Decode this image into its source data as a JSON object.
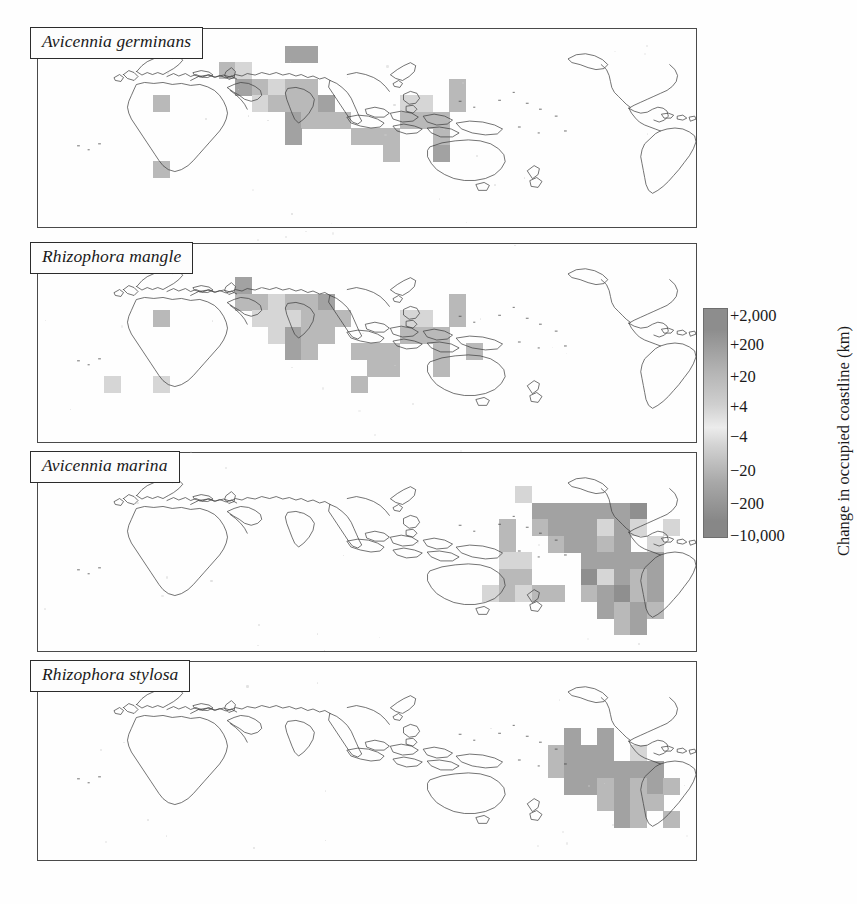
{
  "figure": {
    "type": "four-panel world map grid",
    "panels": [
      {
        "id": "panel-1",
        "species": "Avicennia germinans"
      },
      {
        "id": "panel-2",
        "species": "Rhizophora mangle"
      },
      {
        "id": "panel-3",
        "species": "Avicennia marina"
      },
      {
        "id": "panel-4",
        "species": "Rhizophora stylosa"
      }
    ]
  },
  "legend": {
    "title": "Change in occupied coastline (km)",
    "ticks": [
      "+2,000",
      "+200",
      "+20",
      "+4",
      "−4",
      "−20",
      "−200",
      "−10,000"
    ],
    "colors": {
      "high_positive": "#8d8d8d",
      "mid_positive": "#b5b5b5",
      "neutral_light": "#ececec",
      "mid_negative": "#a8a8a8",
      "high_negative": "#878787"
    }
  },
  "chart_data": {
    "type": "heatmap",
    "title": "Change in occupied coastline (km)",
    "xlabel": "Longitude",
    "ylabel": "Latitude",
    "grid": true,
    "legend_position": "right",
    "projection": "equirectangular, Pacific-centred",
    "cell_size_deg": 10,
    "colorbar_ticks": [
      "+2,000",
      "+200",
      "+20",
      "+4",
      "−4",
      "−20",
      "−200",
      "−10,000"
    ],
    "panels": [
      {
        "name": "Avicennia germinans",
        "cells": [
          {
            "cx": 7,
            "cy": 4,
            "v": "+20"
          },
          {
            "cx": 7,
            "cy": 8,
            "v": "+20"
          },
          {
            "cx": 11,
            "cy": 2,
            "v": "+20"
          },
          {
            "cx": 12,
            "cy": 2,
            "v": "+4"
          },
          {
            "cx": 15,
            "cy": 1,
            "v": "+200"
          },
          {
            "cx": 16,
            "cy": 1,
            "v": "+200"
          },
          {
            "cx": 12,
            "cy": 3,
            "v": "+200"
          },
          {
            "cx": 13,
            "cy": 3,
            "v": "+20"
          },
          {
            "cx": 14,
            "cy": 3,
            "v": "+4"
          },
          {
            "cx": 15,
            "cy": 3,
            "v": "+20"
          },
          {
            "cx": 16,
            "cy": 3,
            "v": "+20"
          },
          {
            "cx": 13,
            "cy": 4,
            "v": "+4"
          },
          {
            "cx": 14,
            "cy": 4,
            "v": "+20"
          },
          {
            "cx": 15,
            "cy": 4,
            "v": "+20"
          },
          {
            "cx": 16,
            "cy": 4,
            "v": "+20"
          },
          {
            "cx": 17,
            "cy": 4,
            "v": "+200"
          },
          {
            "cx": 15,
            "cy": 5,
            "v": "+200"
          },
          {
            "cx": 16,
            "cy": 5,
            "v": "+20"
          },
          {
            "cx": 17,
            "cy": 5,
            "v": "+20"
          },
          {
            "cx": 18,
            "cy": 5,
            "v": "+20"
          },
          {
            "cx": 15,
            "cy": 6,
            "v": "+200"
          },
          {
            "cx": 19,
            "cy": 6,
            "v": "+20"
          },
          {
            "cx": 20,
            "cy": 6,
            "v": "+20"
          },
          {
            "cx": 21,
            "cy": 6,
            "v": "+20"
          },
          {
            "cx": 21,
            "cy": 7,
            "v": "+20"
          },
          {
            "cx": 25,
            "cy": 3,
            "v": "+20"
          },
          {
            "cx": 25,
            "cy": 4,
            "v": "+20"
          },
          {
            "cx": 22,
            "cy": 4,
            "v": "+4"
          },
          {
            "cx": 23,
            "cy": 4,
            "v": "+4"
          },
          {
            "cx": 22,
            "cy": 5,
            "v": "+20"
          },
          {
            "cx": 23,
            "cy": 5,
            "v": "+20"
          },
          {
            "cx": 24,
            "cy": 5,
            "v": "+20"
          },
          {
            "cx": 24,
            "cy": 6,
            "v": "+20"
          },
          {
            "cx": 24,
            "cy": 7,
            "v": "+200"
          }
        ]
      },
      {
        "name": "Rhizophora mangle",
        "cells": [
          {
            "cx": 7,
            "cy": 4,
            "v": "+20"
          },
          {
            "cx": 7,
            "cy": 8,
            "v": "+4"
          },
          {
            "cx": 4,
            "cy": 8,
            "v": "+4"
          },
          {
            "cx": 12,
            "cy": 2,
            "v": "+200"
          },
          {
            "cx": 12,
            "cy": 3,
            "v": "+20"
          },
          {
            "cx": 13,
            "cy": 3,
            "v": "+20"
          },
          {
            "cx": 14,
            "cy": 3,
            "v": "+4"
          },
          {
            "cx": 15,
            "cy": 3,
            "v": "+20"
          },
          {
            "cx": 16,
            "cy": 3,
            "v": "+20"
          },
          {
            "cx": 17,
            "cy": 3,
            "v": "+200"
          },
          {
            "cx": 13,
            "cy": 4,
            "v": "+4"
          },
          {
            "cx": 14,
            "cy": 4,
            "v": "+4"
          },
          {
            "cx": 15,
            "cy": 4,
            "v": "+4"
          },
          {
            "cx": 16,
            "cy": 4,
            "v": "+20"
          },
          {
            "cx": 17,
            "cy": 4,
            "v": "+20"
          },
          {
            "cx": 18,
            "cy": 4,
            "v": "+20"
          },
          {
            "cx": 14,
            "cy": 5,
            "v": "+4"
          },
          {
            "cx": 15,
            "cy": 5,
            "v": "+200"
          },
          {
            "cx": 16,
            "cy": 5,
            "v": "+20"
          },
          {
            "cx": 17,
            "cy": 5,
            "v": "+20"
          },
          {
            "cx": 15,
            "cy": 6,
            "v": "+200"
          },
          {
            "cx": 16,
            "cy": 6,
            "v": "+20"
          },
          {
            "cx": 19,
            "cy": 6,
            "v": "+20"
          },
          {
            "cx": 20,
            "cy": 6,
            "v": "+20"
          },
          {
            "cx": 21,
            "cy": 6,
            "v": "+20"
          },
          {
            "cx": 20,
            "cy": 7,
            "v": "+20"
          },
          {
            "cx": 21,
            "cy": 7,
            "v": "+20"
          },
          {
            "cx": 19,
            "cy": 8,
            "v": "+20"
          },
          {
            "cx": 25,
            "cy": 3,
            "v": "+20"
          },
          {
            "cx": 25,
            "cy": 4,
            "v": "+20"
          },
          {
            "cx": 22,
            "cy": 4,
            "v": "+4"
          },
          {
            "cx": 23,
            "cy": 4,
            "v": "+4"
          },
          {
            "cx": 22,
            "cy": 5,
            "v": "+20"
          },
          {
            "cx": 23,
            "cy": 5,
            "v": "+20"
          },
          {
            "cx": 24,
            "cy": 5,
            "v": "+20"
          },
          {
            "cx": 24,
            "cy": 6,
            "v": "+20"
          },
          {
            "cx": 24,
            "cy": 7,
            "v": "+20"
          },
          {
            "cx": 26,
            "cy": 6,
            "v": "+20"
          }
        ]
      },
      {
        "name": "Avicennia marina",
        "cells": [
          {
            "cx": 29,
            "cy": 2,
            "v": "+4"
          },
          {
            "cx": 28,
            "cy": 4,
            "v": "+20"
          },
          {
            "cx": 28,
            "cy": 5,
            "v": "+20"
          },
          {
            "cx": 28,
            "cy": 6,
            "v": "+4"
          },
          {
            "cx": 29,
            "cy": 6,
            "v": "+4"
          },
          {
            "cx": 28,
            "cy": 7,
            "v": "+20"
          },
          {
            "cx": 29,
            "cy": 7,
            "v": "+20"
          },
          {
            "cx": 27,
            "cy": 8,
            "v": "+4"
          },
          {
            "cx": 28,
            "cy": 8,
            "v": "+20"
          },
          {
            "cx": 29,
            "cy": 8,
            "v": "+4"
          },
          {
            "cx": 30,
            "cy": 3,
            "v": "+200"
          },
          {
            "cx": 31,
            "cy": 3,
            "v": "+200"
          },
          {
            "cx": 32,
            "cy": 3,
            "v": "+200"
          },
          {
            "cx": 33,
            "cy": 3,
            "v": "+200"
          },
          {
            "cx": 34,
            "cy": 3,
            "v": "+200"
          },
          {
            "cx": 35,
            "cy": 3,
            "v": "+200"
          },
          {
            "cx": 36,
            "cy": 3,
            "v": "+2,000"
          },
          {
            "cx": 30,
            "cy": 4,
            "v": "+20"
          },
          {
            "cx": 31,
            "cy": 4,
            "v": "+200"
          },
          {
            "cx": 32,
            "cy": 4,
            "v": "+200"
          },
          {
            "cx": 33,
            "cy": 4,
            "v": "+200"
          },
          {
            "cx": 34,
            "cy": 4,
            "v": "+4"
          },
          {
            "cx": 35,
            "cy": 4,
            "v": "+200"
          },
          {
            "cx": 36,
            "cy": 4,
            "v": "+4"
          },
          {
            "cx": 38,
            "cy": 4,
            "v": "+4"
          },
          {
            "cx": 31,
            "cy": 5,
            "v": "+20"
          },
          {
            "cx": 32,
            "cy": 5,
            "v": "+200"
          },
          {
            "cx": 33,
            "cy": 5,
            "v": "+200"
          },
          {
            "cx": 34,
            "cy": 5,
            "v": "+20"
          },
          {
            "cx": 35,
            "cy": 5,
            "v": "+200"
          },
          {
            "cx": 37,
            "cy": 5,
            "v": "+4"
          },
          {
            "cx": 33,
            "cy": 6,
            "v": "+200"
          },
          {
            "cx": 34,
            "cy": 6,
            "v": "+200"
          },
          {
            "cx": 35,
            "cy": 6,
            "v": "+200"
          },
          {
            "cx": 36,
            "cy": 6,
            "v": "+200"
          },
          {
            "cx": 37,
            "cy": 6,
            "v": "+200"
          },
          {
            "cx": 30,
            "cy": 8,
            "v": "+20"
          },
          {
            "cx": 31,
            "cy": 8,
            "v": "+20"
          },
          {
            "cx": 33,
            "cy": 7,
            "v": "+2,000"
          },
          {
            "cx": 34,
            "cy": 7,
            "v": "+4"
          },
          {
            "cx": 35,
            "cy": 7,
            "v": "+200"
          },
          {
            "cx": 36,
            "cy": 7,
            "v": "+20"
          },
          {
            "cx": 37,
            "cy": 7,
            "v": "+200"
          },
          {
            "cx": 33,
            "cy": 8,
            "v": "+20"
          },
          {
            "cx": 34,
            "cy": 8,
            "v": "+200"
          },
          {
            "cx": 35,
            "cy": 8,
            "v": "+2,000"
          },
          {
            "cx": 36,
            "cy": 8,
            "v": "+20"
          },
          {
            "cx": 37,
            "cy": 8,
            "v": "+200"
          },
          {
            "cx": 34,
            "cy": 9,
            "v": "+200"
          },
          {
            "cx": 35,
            "cy": 9,
            "v": "+20"
          },
          {
            "cx": 36,
            "cy": 9,
            "v": "+200"
          },
          {
            "cx": 37,
            "cy": 9,
            "v": "+20"
          },
          {
            "cx": 35,
            "cy": 10,
            "v": "+20"
          },
          {
            "cx": 36,
            "cy": 10,
            "v": "+200"
          }
        ]
      },
      {
        "name": "Rhizophora stylosa",
        "cells": [
          {
            "cx": 32,
            "cy": 4,
            "v": "+200"
          },
          {
            "cx": 34,
            "cy": 4,
            "v": "+200"
          },
          {
            "cx": 31,
            "cy": 5,
            "v": "+20"
          },
          {
            "cx": 32,
            "cy": 5,
            "v": "+200"
          },
          {
            "cx": 33,
            "cy": 5,
            "v": "+200"
          },
          {
            "cx": 34,
            "cy": 5,
            "v": "+200"
          },
          {
            "cx": 36,
            "cy": 5,
            "v": "+4"
          },
          {
            "cx": 31,
            "cy": 6,
            "v": "+20"
          },
          {
            "cx": 32,
            "cy": 6,
            "v": "+200"
          },
          {
            "cx": 33,
            "cy": 6,
            "v": "+200"
          },
          {
            "cx": 34,
            "cy": 6,
            "v": "+200"
          },
          {
            "cx": 35,
            "cy": 6,
            "v": "+200"
          },
          {
            "cx": 36,
            "cy": 6,
            "v": "+200"
          },
          {
            "cx": 37,
            "cy": 6,
            "v": "+200"
          },
          {
            "cx": 32,
            "cy": 7,
            "v": "+200"
          },
          {
            "cx": 33,
            "cy": 7,
            "v": "+200"
          },
          {
            "cx": 34,
            "cy": 7,
            "v": "+20"
          },
          {
            "cx": 35,
            "cy": 7,
            "v": "+200"
          },
          {
            "cx": 36,
            "cy": 7,
            "v": "+20"
          },
          {
            "cx": 37,
            "cy": 7,
            "v": "+200"
          },
          {
            "cx": 38,
            "cy": 7,
            "v": "+20"
          },
          {
            "cx": 34,
            "cy": 8,
            "v": "+20"
          },
          {
            "cx": 35,
            "cy": 8,
            "v": "+200"
          },
          {
            "cx": 36,
            "cy": 8,
            "v": "+20"
          },
          {
            "cx": 37,
            "cy": 8,
            "v": "+20"
          },
          {
            "cx": 35,
            "cy": 9,
            "v": "+200"
          },
          {
            "cx": 36,
            "cy": 9,
            "v": "+20"
          },
          {
            "cx": 38,
            "cy": 9,
            "v": "+20"
          }
        ]
      }
    ]
  }
}
